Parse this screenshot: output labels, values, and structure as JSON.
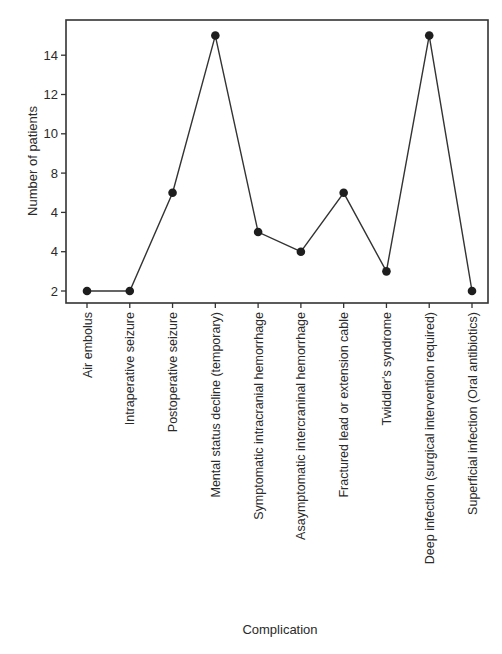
{
  "chart_data": {
    "type": "line",
    "title": "",
    "xlabel": "Complication",
    "ylabel": "Number of patients",
    "ylim": [
      1.4,
      16
    ],
    "yticks": [
      2,
      4,
      6,
      8,
      10,
      12,
      14
    ],
    "ytick_labels": [
      "2",
      "4",
      "4",
      "8",
      "10",
      "12",
      "14"
    ],
    "grid": false,
    "legend": null,
    "categories": [
      "Air embolus",
      "Intraperative seizure",
      "Postoperative seizure",
      "Mental status decline (temporary)",
      "Symptomatic intracranial hemorrhage",
      "Asaymptomatic intercraninal hemorrhage",
      "Fractured lead or extension cable",
      "Twiddler's syndrome",
      "Deep infection (surgical intervention required)",
      "Superficial infection (Oral antibiotics)"
    ],
    "series": [
      {
        "name": "Number of patients",
        "values": [
          2,
          2,
          7,
          15,
          5,
          4,
          7,
          3,
          15,
          2
        ],
        "color": "#333333",
        "marker": "filled-circle"
      }
    ]
  }
}
